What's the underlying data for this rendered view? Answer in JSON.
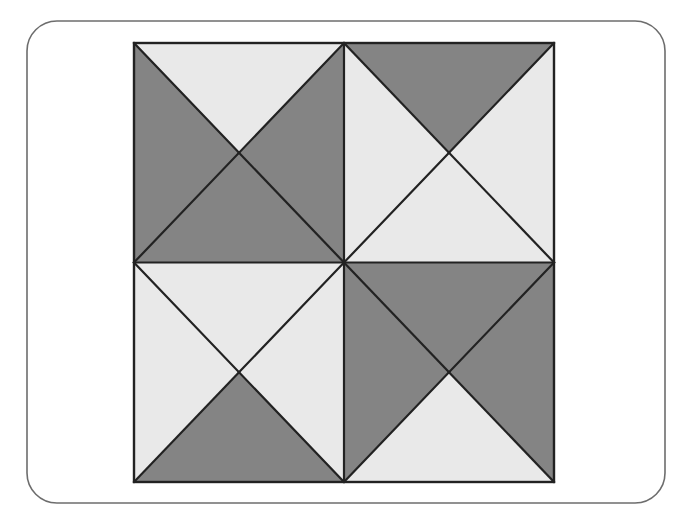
{
  "canvas": {
    "width": 678,
    "height": 523,
    "background_color": "#ffffff"
  },
  "card": {
    "name": "rounded-panel",
    "x": 27,
    "y": 21,
    "width": 638,
    "height": 482,
    "corner_radius": 30,
    "fill_color": "#ffffff",
    "border_color": "#6d6d6d",
    "border_width": 1.6
  },
  "palette": {
    "dark_gray": "#848484",
    "light_gray": "#e9e9e9",
    "stroke": "#222222",
    "outline_width": 2.4,
    "inner_line_width": 2.2
  },
  "figure": {
    "name": "four-quadrant-triangle-tiling",
    "type": "geometric-tiling",
    "square": {
      "left": 134,
      "top": 43,
      "right": 554,
      "bottom": 482,
      "width": 420,
      "height": 439
    },
    "center": {
      "x": 344,
      "y": 262.5
    },
    "quadrant_size": {
      "width": 210,
      "height": 219.5
    },
    "quadrants": [
      {
        "id": "top-left",
        "bounds": {
          "left": 134,
          "top": 43,
          "right": 344,
          "bottom": 262.5
        },
        "center": {
          "x": 239,
          "y": 152.75
        },
        "diagonal": "top-right-to-bottom-left",
        "triangles": [
          {
            "name": "tl-left-wedge",
            "fill": "dark_gray",
            "points": "134,43 239,152.75 134,262.5"
          },
          {
            "name": "tl-top-wedge",
            "fill": "light_gray",
            "points": "134,43 344,43 239,152.75"
          },
          {
            "name": "tl-large-diagonal-half",
            "fill": "dark_gray",
            "points": "344,43 344,262.5 134,262.5"
          }
        ]
      },
      {
        "id": "top-right",
        "bounds": {
          "left": 344,
          "top": 43,
          "right": 554,
          "bottom": 262.5
        },
        "center": {
          "x": 449,
          "y": 152.75
        },
        "diagonal": "top-left-to-bottom-right",
        "triangles": [
          {
            "name": "tr-top-wedge",
            "fill": "dark_gray",
            "points": "344,43 554,43 449,152.75"
          },
          {
            "name": "tr-right-wedge",
            "fill": "light_gray",
            "points": "554,43 554,262.5 449,152.75"
          },
          {
            "name": "tr-large-diagonal-half",
            "fill": "light_gray",
            "points": "344,43 554,262.5 344,262.5"
          }
        ]
      },
      {
        "id": "bottom-left",
        "bounds": {
          "left": 134,
          "top": 262.5,
          "right": 344,
          "bottom": 482
        },
        "center": {
          "x": 239,
          "y": 372.25
        },
        "diagonal": "top-left-to-bottom-right",
        "triangles": [
          {
            "name": "bl-large-diagonal-half",
            "fill": "light_gray",
            "points": "134,262.5 344,262.5 344,482"
          },
          {
            "name": "bl-left-wedge",
            "fill": "light_gray",
            "points": "134,262.5 239,372.25 134,482"
          },
          {
            "name": "bl-bottom-wedge",
            "fill": "dark_gray",
            "points": "134,482 239,372.25 344,482"
          }
        ]
      },
      {
        "id": "bottom-right",
        "bounds": {
          "left": 344,
          "top": 262.5,
          "right": 554,
          "bottom": 482
        },
        "center": {
          "x": 449,
          "y": 372.25
        },
        "diagonal": "top-right-to-bottom-left",
        "triangles": [
          {
            "name": "br-large-diagonal-half",
            "fill": "dark_gray",
            "points": "344,262.5 554,262.5 344,482"
          },
          {
            "name": "br-right-wedge",
            "fill": "dark_gray",
            "points": "554,262.5 554,482 449,372.25"
          },
          {
            "name": "br-bottom-wedge",
            "fill": "light_gray",
            "points": "344,482 449,372.25 554,482"
          }
        ]
      }
    ],
    "grid_lines": [
      {
        "name": "vertical-center-line",
        "x1": 344,
        "y1": 43,
        "x2": 344,
        "y2": 482
      },
      {
        "name": "horizontal-center-line",
        "x1": 134,
        "y1": 262.5,
        "x2": 554,
        "y2": 262.5
      }
    ]
  }
}
